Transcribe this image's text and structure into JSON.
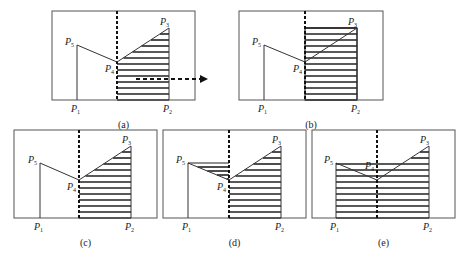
{
  "figure": {
    "panels": [
      {
        "id": "a",
        "caption": "(a)",
        "box": [
          52,
          11,
          195,
          100
        ],
        "divider_x": 117,
        "points": {
          "P1": [
            77,
            100
          ],
          "P5": [
            77,
            45
          ],
          "P4": [
            117,
            62
          ],
          "P3": [
            169,
            28
          ],
          "P2": [
            169,
            100
          ]
        },
        "hatch": "none",
        "arrow": {
          "from": [
            136,
            79
          ],
          "to": [
            208,
            79
          ]
        }
      },
      {
        "id": "b",
        "caption": "(b)",
        "box": [
          239,
          11,
          383,
          100
        ],
        "divider_x": 305,
        "points": {
          "P1": [
            264,
            100
          ],
          "P5": [
            264,
            45
          ],
          "P4": [
            305,
            62
          ],
          "P3": [
            357,
            28
          ],
          "P2": [
            357,
            100
          ]
        },
        "hatch": "rectangle-right"
      },
      {
        "id": "c",
        "caption": "(c)",
        "box": [
          14,
          130,
          157,
          218
        ],
        "divider_x": 79,
        "points": {
          "P1": [
            40,
            218
          ],
          "P5": [
            40,
            163
          ],
          "P4": [
            79,
            180
          ],
          "P3": [
            131,
            146
          ],
          "P2": [
            131,
            218
          ]
        },
        "hatch": "under-right-polyline"
      },
      {
        "id": "d",
        "caption": "(d)",
        "box": [
          163,
          130,
          306,
          218
        ],
        "divider_x": 229,
        "points": {
          "P1": [
            188,
            218
          ],
          "P5": [
            188,
            163
          ],
          "P4": [
            229,
            180
          ],
          "P3": [
            281,
            146
          ],
          "P2": [
            281,
            218
          ]
        },
        "hatch": "under-right-polyline-plus-left-triangle"
      },
      {
        "id": "e",
        "caption": "(e)",
        "box": [
          312,
          130,
          455,
          218
        ],
        "divider_x": 377,
        "points": {
          "P1": [
            336,
            218
          ],
          "P5": [
            336,
            163
          ],
          "P4": [
            377,
            180
          ],
          "P3": [
            429,
            146
          ],
          "P2": [
            429,
            218
          ]
        },
        "hatch": "under-full-polyline"
      }
    ],
    "labels": {
      "P1": "P",
      "P2": "P",
      "P3": "P",
      "P4": "P",
      "P5": "P",
      "s1": "1",
      "s2": "2",
      "s3": "3",
      "s4": "4",
      "s5": "5"
    },
    "colors": {
      "line": "#333333",
      "hatch": "#222222",
      "box": "#555555"
    }
  }
}
